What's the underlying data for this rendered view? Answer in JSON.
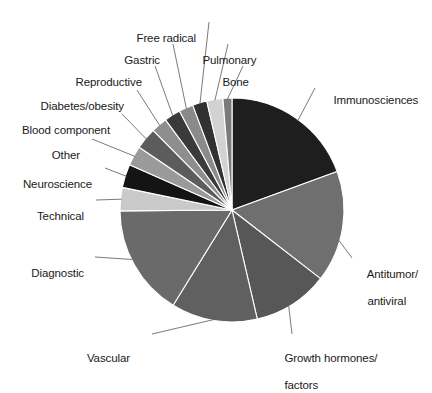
{
  "chart_data": {
    "type": "pie",
    "title": "",
    "subtitle": "",
    "xlabel": "",
    "ylabel": "",
    "legend_position": "callout-labels",
    "grid": false,
    "total_degrees": 360,
    "start_angle_deg": 0,
    "direction": "clockwise",
    "categories": [
      "Immunosciences",
      "Antitumor/\nantiviral",
      "Growth hormones/\nfactors",
      "Vascular",
      "Diagnostic",
      "Technical",
      "Neuroscience",
      "Other",
      "Blood component",
      "Diabetes/obesity",
      "Reproductive",
      "Gastric",
      "Free radical",
      "Pulmonary",
      "Bone"
    ],
    "values": [
      20.8,
      17.2,
      11.7,
      13.3,
      17.2,
      3.6,
      3.6,
      3.1,
      3.3,
      2.5,
      2.5,
      2.2,
      2.2,
      2.5,
      1.4
    ],
    "slices": [
      {
        "label": "Immunosciences",
        "value": 20.8,
        "angle_deg": 75.0,
        "color": "#1e1e1e"
      },
      {
        "label": "Antitumor/\nantiviral",
        "value": 17.2,
        "angle_deg": 62.0,
        "color": "#6f6f6f"
      },
      {
        "label": "Growth hormones/\nfactors",
        "value": 11.7,
        "angle_deg": 42.0,
        "color": "#575757"
      },
      {
        "label": "Vascular",
        "value": 13.3,
        "angle_deg": 48.0,
        "color": "#606060"
      },
      {
        "label": "Diagnostic",
        "value": 17.2,
        "angle_deg": 62.0,
        "color": "#6a6a6a"
      },
      {
        "label": "Technical",
        "value": 3.6,
        "angle_deg": 13.0,
        "color": "#c9c9c9"
      },
      {
        "label": "Neuroscience",
        "value": 3.6,
        "angle_deg": 13.0,
        "color": "#141414"
      },
      {
        "label": "Other",
        "value": 3.1,
        "angle_deg": 11.0,
        "color": "#9a9a9a"
      },
      {
        "label": "Blood component",
        "value": 3.3,
        "angle_deg": 12.0,
        "color": "#5c5c5c"
      },
      {
        "label": "Diabetes/obesity",
        "value": 2.5,
        "angle_deg": 9.0,
        "color": "#8e8e8e"
      },
      {
        "label": "Reproductive",
        "value": 2.5,
        "angle_deg": 9.0,
        "color": "#3a3a3a"
      },
      {
        "label": "Gastric",
        "value": 2.2,
        "angle_deg": 8.0,
        "color": "#8a8a8a"
      },
      {
        "label": "Free radical",
        "value": 2.2,
        "angle_deg": 8.0,
        "color": "#313131"
      },
      {
        "label": "Pulmonary",
        "value": 2.5,
        "angle_deg": 9.0,
        "color": "#d2d2d2"
      },
      {
        "label": "Bone",
        "value": 1.4,
        "angle_deg": 5.0,
        "color": "#7a7a7a"
      }
    ]
  },
  "labels": {
    "immunosciences": "Immunosciences",
    "antitumor_line1": "Antitumor/",
    "antitumor_line2": "antiviral",
    "growth_line1": "Growth hormones/",
    "growth_line2": "factors",
    "vascular": "Vascular",
    "diagnostic": "Diagnostic",
    "technical": "Technical",
    "neuroscience": "Neuroscience",
    "other": "Other",
    "blood_component": "Blood component",
    "diabetes_obesity": "Diabetes/obesity",
    "reproductive": "Reproductive",
    "gastric": "Gastric",
    "free_radical": "Free radical",
    "pulmonary": "Pulmonary",
    "bone": "Bone"
  },
  "style": {
    "background": "#ffffff",
    "text_color": "#1a1a1a",
    "leader_color": "#6b6b6b",
    "slice_separator": "#ffffff"
  },
  "geometry": {
    "center_x": 232,
    "center_y": 210,
    "radius": 112
  }
}
